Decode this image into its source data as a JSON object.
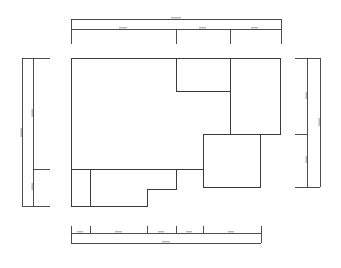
{
  "drawing": {
    "type": "floor-plan",
    "stroke_color": "#3a3a3a",
    "background": "#ffffff"
  },
  "dimensions": {
    "top_total": "",
    "top_segments": [
      "",
      "",
      ""
    ],
    "bottom_total": "",
    "bottom_segments": [
      "",
      "",
      "",
      "",
      ""
    ],
    "left_total": "",
    "left_segments": [
      "",
      ""
    ],
    "right_total": "",
    "right_segments": [
      "",
      ""
    ]
  }
}
